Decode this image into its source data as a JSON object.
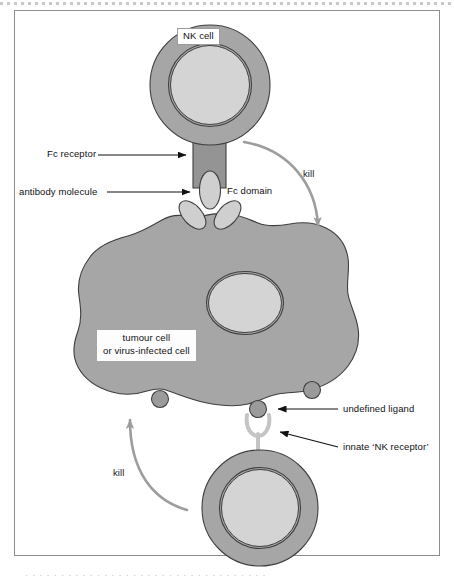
{
  "figure": {
    "frame": {
      "border_color": "#8d8d8d",
      "background": "#ffffff"
    },
    "colors": {
      "cell_body": "#a6a6a6",
      "cell_body_stroke": "#4a4a4a",
      "nucleus_fill": "#d4d4d4",
      "nucleus_stroke": "#4a4a4a",
      "receptor_fill": "#949494",
      "receptor_stroke": "#3f3f3f",
      "antibody_fill": "#cfcfcf",
      "antibody_stroke": "#3f3f3f",
      "ligand_fill": "#9b9b9b",
      "ligand_stroke": "#3f3f3f",
      "nk_receptor_fill": "#c9c9c9",
      "nk_receptor_stroke": "#8f8f8f",
      "kill_arrow": "#9d9d9d",
      "label_arrow": "#111111",
      "label_text": "#111111"
    }
  },
  "labels": {
    "nk_cell": "NK cell",
    "fc_receptor": "Fc receptor",
    "antibody_molecule": "antibody molecule",
    "fc_domain": "Fc domain",
    "tumour_cell_line1": "tumour cell",
    "tumour_cell_line2": "or virus-infected cell",
    "kill_right": "kill",
    "kill_left": "kill",
    "undefined_ligand": "undefined ligand",
    "innate_nk_receptor": "innate ‘NK receptor’"
  },
  "elements": {
    "nk_cell_top": {
      "name": "NK cell (upper)",
      "cx": 210,
      "cy": 85,
      "r_outer": 60,
      "r_nucleus": 40
    },
    "nk_cell_bottom": {
      "name": "NK cell (lower)",
      "cx": 260,
      "cy": 508,
      "r_outer": 58,
      "r_nucleus": 39
    },
    "target_cell": {
      "name": "tumour cell or virus-infected cell",
      "nucleus_cx": 245,
      "nucleus_cy": 303,
      "nucleus_rx": 37,
      "nucleus_ry": 30
    },
    "fc_receptor": {
      "name": "Fc receptor",
      "x": 193,
      "y": 140,
      "width": 33,
      "height": 48
    },
    "antibody": {
      "name": "antibody molecule",
      "fc_domain_cx": 210,
      "fc_domain_cy": 190
    },
    "ligands": [
      {
        "name": "undefined ligand",
        "cx": 160,
        "cy": 399
      },
      {
        "name": "undefined ligand",
        "cx": 258,
        "cy": 409
      },
      {
        "name": "undefined ligand",
        "cx": 312,
        "cy": 390
      }
    ],
    "nk_receptor": {
      "name": "innate NK receptor",
      "cx": 258,
      "cy": 428
    }
  },
  "bottom_text": "caption text continues below the figure"
}
